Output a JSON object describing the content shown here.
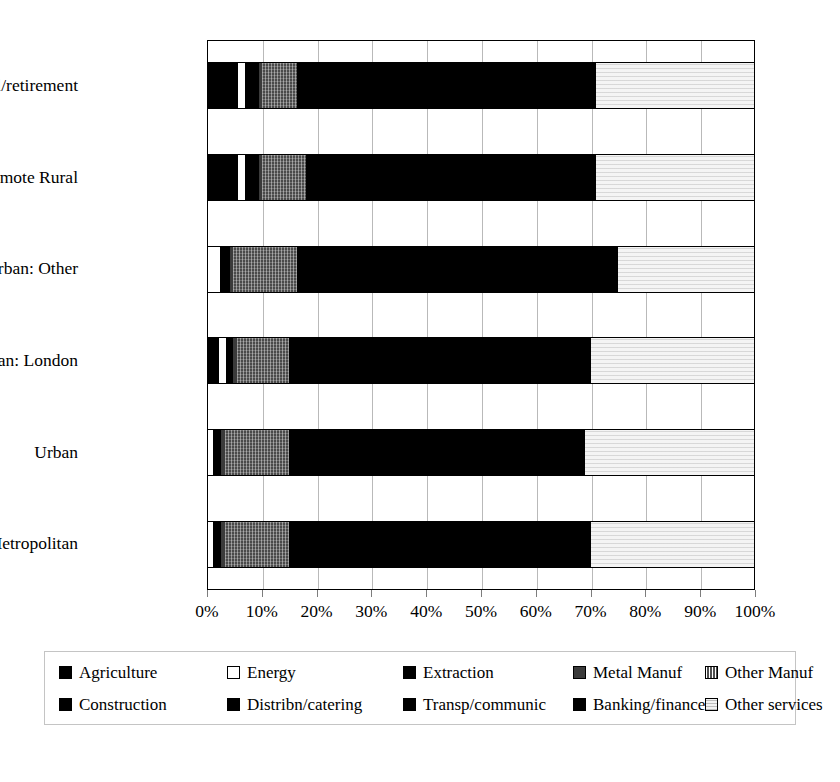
{
  "chart_data": {
    "type": "bar",
    "subtype": "stacked-horizontal-100pct",
    "title": "",
    "xlabel": "",
    "ylabel": "",
    "xlim": [
      0,
      100
    ],
    "xticks": [
      "0%",
      "10%",
      "20%",
      "30%",
      "40%",
      "50%",
      "60%",
      "70%",
      "80%",
      "90%",
      "100%"
    ],
    "grid": true,
    "legend_position": "bottom",
    "categories": [
      "Coastal/retirement",
      "Remote Rural",
      "Peri-urban: Other",
      "Peri-urban: London",
      "Urban",
      "Metropolitan"
    ],
    "series": [
      {
        "name": "Agriculture",
        "pattern": "solid-black",
        "values": [
          5.5,
          5.5,
          0.0,
          2.0,
          0.0,
          0.0
        ]
      },
      {
        "name": "Energy",
        "pattern": "white",
        "values": [
          1.6,
          1.6,
          2.6,
          1.6,
          1.3,
          1.3
        ]
      },
      {
        "name": "Extraction",
        "pattern": "solid-black",
        "values": [
          2.4,
          2.4,
          1.6,
          1.2,
          1.3,
          1.3
        ]
      },
      {
        "name": "Metal Manuf",
        "pattern": "dark-grey",
        "values": [
          0.5,
          0.5,
          0.6,
          0.6,
          0.6,
          0.6
        ]
      },
      {
        "name": "Other Manuf",
        "pattern": "hatched-grey",
        "values": [
          6.5,
          8.0,
          11.7,
          9.6,
          11.8,
          11.8
        ]
      },
      {
        "name": "Construction",
        "pattern": "solid-black",
        "values": [
          6.0,
          6.0,
          6.0,
          6.0,
          6.0,
          6.0
        ]
      },
      {
        "name": "Distribn/catering",
        "pattern": "solid-black",
        "values": [
          22.0,
          22.0,
          22.0,
          22.0,
          22.0,
          22.0
        ]
      },
      {
        "name": "Transp/communic",
        "pattern": "solid-black",
        "values": [
          12.0,
          12.0,
          12.0,
          12.0,
          12.0,
          12.0
        ]
      },
      {
        "name": "Banking/finance",
        "pattern": "solid-black",
        "values": [
          14.5,
          13.0,
          18.5,
          17.0,
          16.0,
          17.0
        ]
      },
      {
        "name": "Other services",
        "pattern": "light-grey",
        "values": [
          29.0,
          29.0,
          25.0,
          30.0,
          31.0,
          30.0
        ]
      }
    ],
    "bar_stacks": [
      {
        "category": "Coastal/retirement",
        "segments": [
          {
            "series": "Agriculture",
            "style": "solid",
            "start": 0.0,
            "end": 5.5
          },
          {
            "series": "Energy",
            "style": "white",
            "start": 5.5,
            "end": 7.1
          },
          {
            "series": "Extraction",
            "style": "solid",
            "start": 7.1,
            "end": 9.5
          },
          {
            "series": "Metal Manuf",
            "style": "metal",
            "start": 9.5,
            "end": 10.0
          },
          {
            "series": "Other Manuf",
            "style": "othermanuf",
            "start": 10.0,
            "end": 16.5
          },
          {
            "series": "Construction",
            "style": "solid",
            "start": 16.5,
            "end": 22.5
          },
          {
            "series": "Distribn/catering",
            "style": "solid",
            "start": 22.5,
            "end": 44.5
          },
          {
            "series": "Transp/communic",
            "style": "solid",
            "start": 44.5,
            "end": 56.5
          },
          {
            "series": "Banking/finance",
            "style": "solid",
            "start": 56.5,
            "end": 71.0
          },
          {
            "series": "Other services",
            "style": "services",
            "start": 71.0,
            "end": 100.0
          }
        ]
      },
      {
        "category": "Remote Rural",
        "segments": [
          {
            "series": "Agriculture",
            "style": "solid",
            "start": 0.0,
            "end": 5.5
          },
          {
            "series": "Energy",
            "style": "white",
            "start": 5.5,
            "end": 7.1
          },
          {
            "series": "Extraction",
            "style": "solid",
            "start": 7.1,
            "end": 9.5
          },
          {
            "series": "Metal Manuf",
            "style": "metal",
            "start": 9.5,
            "end": 10.0
          },
          {
            "series": "Other Manuf",
            "style": "othermanuf",
            "start": 10.0,
            "end": 18.0
          },
          {
            "series": "Construction",
            "style": "solid",
            "start": 18.0,
            "end": 24.0
          },
          {
            "series": "Distribn/catering",
            "style": "solid",
            "start": 24.0,
            "end": 46.0
          },
          {
            "series": "Transp/communic",
            "style": "solid",
            "start": 46.0,
            "end": 58.0
          },
          {
            "series": "Banking/finance",
            "style": "solid",
            "start": 58.0,
            "end": 71.0
          },
          {
            "series": "Other services",
            "style": "services",
            "start": 71.0,
            "end": 100.0
          }
        ]
      },
      {
        "category": "Peri-urban: Other",
        "segments": [
          {
            "series": "Energy",
            "style": "white",
            "start": 0.0,
            "end": 2.6
          },
          {
            "series": "Extraction",
            "style": "solid",
            "start": 2.6,
            "end": 4.2
          },
          {
            "series": "Metal Manuf",
            "style": "metal",
            "start": 4.2,
            "end": 4.8
          },
          {
            "series": "Other Manuf",
            "style": "othermanuf",
            "start": 4.8,
            "end": 16.5
          },
          {
            "series": "Construction",
            "style": "solid",
            "start": 16.5,
            "end": 22.5
          },
          {
            "series": "Distribn/catering",
            "style": "solid",
            "start": 22.5,
            "end": 44.5
          },
          {
            "series": "Transp/communic",
            "style": "solid",
            "start": 44.5,
            "end": 56.5
          },
          {
            "series": "Banking/finance",
            "style": "solid",
            "start": 56.5,
            "end": 75.0
          },
          {
            "series": "Other services",
            "style": "services",
            "start": 75.0,
            "end": 100.0
          }
        ]
      },
      {
        "category": "Peri-urban: London",
        "segments": [
          {
            "series": "Agriculture",
            "style": "solid",
            "start": 0.0,
            "end": 2.0
          },
          {
            "series": "Energy",
            "style": "white",
            "start": 2.0,
            "end": 3.6
          },
          {
            "series": "Extraction",
            "style": "solid",
            "start": 3.6,
            "end": 4.8
          },
          {
            "series": "Metal Manuf",
            "style": "metal",
            "start": 4.8,
            "end": 5.4
          },
          {
            "series": "Other Manuf",
            "style": "othermanuf",
            "start": 5.4,
            "end": 15.0
          },
          {
            "series": "Construction",
            "style": "solid",
            "start": 15.0,
            "end": 21.0
          },
          {
            "series": "Distribn/catering",
            "style": "solid",
            "start": 21.0,
            "end": 43.0
          },
          {
            "series": "Transp/communic",
            "style": "solid",
            "start": 43.0,
            "end": 55.0
          },
          {
            "series": "Banking/finance",
            "style": "solid",
            "start": 55.0,
            "end": 70.0
          },
          {
            "series": "Other services",
            "style": "services",
            "start": 70.0,
            "end": 100.0
          }
        ]
      },
      {
        "category": "Urban",
        "segments": [
          {
            "series": "Energy",
            "style": "white",
            "start": 0.0,
            "end": 1.3
          },
          {
            "series": "Extraction",
            "style": "solid",
            "start": 1.3,
            "end": 2.6
          },
          {
            "series": "Metal Manuf",
            "style": "metal",
            "start": 2.6,
            "end": 3.2
          },
          {
            "series": "Other Manuf",
            "style": "othermanuf",
            "start": 3.2,
            "end": 15.0
          },
          {
            "series": "Construction",
            "style": "solid",
            "start": 15.0,
            "end": 21.0
          },
          {
            "series": "Distribn/catering",
            "style": "solid",
            "start": 21.0,
            "end": 43.0
          },
          {
            "series": "Transp/communic",
            "style": "solid",
            "start": 43.0,
            "end": 55.0
          },
          {
            "series": "Banking/finance",
            "style": "solid",
            "start": 55.0,
            "end": 69.0
          },
          {
            "series": "Other services",
            "style": "services",
            "start": 69.0,
            "end": 100.0
          }
        ]
      },
      {
        "category": "Metropolitan",
        "segments": [
          {
            "series": "Energy",
            "style": "white",
            "start": 0.0,
            "end": 1.3
          },
          {
            "series": "Extraction",
            "style": "solid",
            "start": 1.3,
            "end": 2.6
          },
          {
            "series": "Metal Manuf",
            "style": "metal",
            "start": 2.6,
            "end": 3.2
          },
          {
            "series": "Other Manuf",
            "style": "othermanuf",
            "start": 3.2,
            "end": 15.0
          },
          {
            "series": "Construction",
            "style": "solid",
            "start": 15.0,
            "end": 21.0
          },
          {
            "series": "Distribn/catering",
            "style": "solid",
            "start": 21.0,
            "end": 43.0
          },
          {
            "series": "Transp/communic",
            "style": "solid",
            "start": 43.0,
            "end": 55.0
          },
          {
            "series": "Banking/finance",
            "style": "solid",
            "start": 55.0,
            "end": 70.0
          },
          {
            "series": "Other services",
            "style": "services",
            "start": 70.0,
            "end": 100.0
          }
        ]
      }
    ],
    "legend": [
      {
        "label": "Agriculture",
        "swatch": "sw-solid"
      },
      {
        "label": "Energy",
        "swatch": "sw-white"
      },
      {
        "label": "Extraction",
        "swatch": "sw-solid"
      },
      {
        "label": "Metal Manuf",
        "swatch": "sw-metal"
      },
      {
        "label": "Other Manuf",
        "swatch": "sw-othermanuf"
      },
      {
        "label": "Construction",
        "swatch": "sw-solid"
      },
      {
        "label": "Distribn/catering",
        "swatch": "sw-solid"
      },
      {
        "label": "Transp/communic",
        "swatch": "sw-solid"
      },
      {
        "label": "Banking/finance",
        "swatch": "sw-solid"
      },
      {
        "label": "Other services",
        "swatch": "sw-services"
      }
    ],
    "colors": {
      "plot_background": "#ffffff",
      "axis_line": "#000000",
      "gridline": "#b9b9b9",
      "solid": "#000000",
      "metal": "#3b3b3b",
      "other_manuf": "#4a4a4a",
      "other_services": "#f4f4f4",
      "legend_border": "#c4c4c4"
    }
  }
}
